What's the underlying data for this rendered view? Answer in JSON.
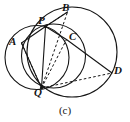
{
  "figure": {
    "caption": "(c)",
    "caption_x": 0,
    "caption_y": 105,
    "width": 130,
    "height": 122,
    "background": "#ffffff",
    "stroke_color": "#151515",
    "stroke_width": 1.1,
    "dash_pattern": "2.6,2.2",
    "type": "euclidean-geometry-diagram"
  },
  "points": [
    {
      "id": "A",
      "label": "A",
      "x": 21.5,
      "y": 43.0,
      "label_x": 9,
      "label_y": 35.5,
      "dot": false
    },
    {
      "id": "B",
      "label": "B",
      "x": 67.5,
      "y": 12.0,
      "label_x": 62,
      "label_y": 1.5,
      "dot": false
    },
    {
      "id": "C",
      "label": "C",
      "x": 66.5,
      "y": 39.5,
      "label_x": 69,
      "label_y": 30.5,
      "dot": false
    },
    {
      "id": "D",
      "label": "D",
      "x": 112.0,
      "y": 73.0,
      "label_x": 114,
      "label_y": 64.5,
      "dot": false
    },
    {
      "id": "P",
      "label": "P",
      "x": 45.5,
      "y": 26.5,
      "label_x": 38,
      "label_y": 14.5,
      "dot": true
    },
    {
      "id": "Q",
      "label": "Q",
      "x": 41.5,
      "y": 88.0,
      "label_x": 34,
      "label_y": 86.5,
      "dot": true
    }
  ],
  "circles": [
    {
      "id": "large-circumcircle",
      "cx": 72.0,
      "cy": 52.0,
      "r": 45.0,
      "style": "solid"
    },
    {
      "id": "left-circle-APQ",
      "cx": 37.0,
      "cy": 57.5,
      "r": 32.0,
      "style": "solid"
    },
    {
      "id": "inner-circle-PCQ",
      "cx": 53.5,
      "cy": 56.0,
      "r": 32.0,
      "style": "solid"
    }
  ],
  "solid_segments": [
    {
      "id": "segment-A-P",
      "from": "A",
      "to": "P"
    },
    {
      "id": "segment-P-B",
      "from": "P",
      "to": "B"
    },
    {
      "id": "segment-P-C",
      "from": "P",
      "to": "C"
    },
    {
      "id": "segment-C-D",
      "from": "C",
      "to": "D"
    },
    {
      "id": "segment-P-Q",
      "from": "P",
      "to": "Q"
    },
    {
      "id": "segment-A-Q",
      "from": "A",
      "to": "Q"
    }
  ],
  "dashed_segments": [
    {
      "id": "dashed-P-B",
      "from": "P",
      "to": "B"
    },
    {
      "id": "dashed-Q-B",
      "from": "Q",
      "to": "B"
    },
    {
      "id": "dashed-Q-C",
      "from": "Q",
      "to": "C"
    },
    {
      "id": "dashed-Q-D",
      "from": "Q",
      "to": "D"
    },
    {
      "id": "dashed-A-Q",
      "from": "A",
      "to": "Q"
    }
  ]
}
